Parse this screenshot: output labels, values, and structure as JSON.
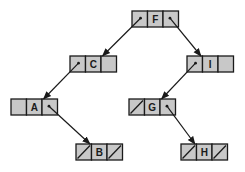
{
  "diagram": {
    "type": "binary-tree-linked-representation",
    "colors": {
      "cell_fill": "#c8c8c8",
      "stroke": "#1a1a1a",
      "background": "#ffffff"
    },
    "nodes": [
      {
        "id": "F",
        "label": "F",
        "x": 132,
        "y": 11,
        "left": "C",
        "right": "I"
      },
      {
        "id": "C",
        "label": "C",
        "x": 70,
        "y": 56,
        "left": "A",
        "right": null,
        "right_empty": true
      },
      {
        "id": "I",
        "label": "I",
        "x": 187,
        "y": 56,
        "left": "G",
        "right": null,
        "right_empty": true
      },
      {
        "id": "A",
        "label": "A",
        "x": 11,
        "y": 99,
        "left": null,
        "left_empty": true,
        "right": "B"
      },
      {
        "id": "G",
        "label": "G",
        "x": 129,
        "y": 99,
        "left": null,
        "right": "H"
      },
      {
        "id": "B",
        "label": "B",
        "x": 76,
        "y": 144,
        "left": null,
        "right": null
      },
      {
        "id": "H",
        "label": "H",
        "x": 181,
        "y": 144,
        "left": null,
        "right": null
      }
    ],
    "edges": [
      {
        "from": "F",
        "to": "C"
      },
      {
        "from": "F",
        "to": "I"
      },
      {
        "from": "C",
        "to": "A"
      },
      {
        "from": "I",
        "to": "G"
      },
      {
        "from": "A",
        "to": "B"
      },
      {
        "from": "G",
        "to": "H"
      }
    ]
  }
}
